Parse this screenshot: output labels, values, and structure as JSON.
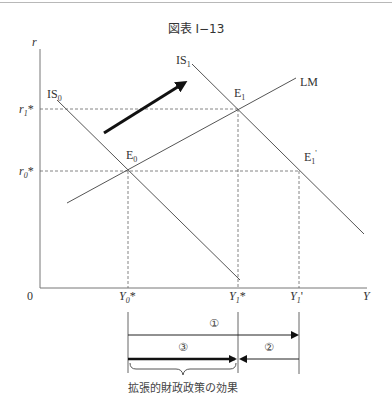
{
  "figure": {
    "title": "図表 I−13",
    "axes": {
      "y_label": "r",
      "x_label": "Y",
      "origin_label": "0",
      "y_ticks": [
        {
          "label": "r",
          "sub": "1",
          "suffix": "*",
          "key": "r1"
        },
        {
          "label": "r",
          "sub": "0",
          "suffix": "*",
          "key": "r0"
        }
      ],
      "x_ticks": [
        {
          "label": "Y",
          "sub": "0",
          "suffix": "*",
          "key": "Y0"
        },
        {
          "label": "Y",
          "sub": "1",
          "suffix": "*",
          "key": "Y1"
        },
        {
          "label": "Y",
          "sub": "1",
          "suffix": "'",
          "key": "Y1p"
        }
      ]
    },
    "curves": [
      {
        "name": "IS",
        "sub": "0",
        "key": "IS0"
      },
      {
        "name": "IS",
        "sub": "1",
        "key": "IS1"
      },
      {
        "name": "LM",
        "sub": "",
        "key": "LM"
      }
    ],
    "points": [
      {
        "name": "E",
        "sub": "0",
        "suffix": "",
        "key": "E0"
      },
      {
        "name": "E",
        "sub": "1",
        "suffix": "",
        "key": "E1"
      },
      {
        "name": "E",
        "sub": "1",
        "suffix": "'",
        "key": "E1p"
      }
    ],
    "shift_arrow": "IS0 → IS1 shift",
    "bottom_diagram": {
      "arrow_1_label": "①",
      "arrow_2_label": "②",
      "arrow_3_label": "③",
      "brace_caption": "拡張的財政政策の効果"
    }
  }
}
